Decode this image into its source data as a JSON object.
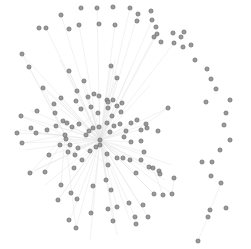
{
  "graph": {
    "title": "",
    "width": 251,
    "height": 249,
    "node_radius": 2.1,
    "colors": {
      "background": "#ffffff",
      "node_fill": "#9a9a9a",
      "node_stroke": "#5c5c5c",
      "edge": "#e4e4e4"
    },
    "hubs": [
      {
        "id": "hub1",
        "x": 100,
        "y": 140
      },
      {
        "id": "hub2",
        "x": 65,
        "y": 135
      }
    ],
    "nodes": [
      [
        61,
        15
      ],
      [
        81,
        8
      ],
      [
        97,
        8
      ],
      [
        113,
        7
      ],
      [
        130,
        8
      ],
      [
        151,
        11
      ],
      [
        138,
        14
      ],
      [
        39,
        28
      ],
      [
        46,
        28
      ],
      [
        69,
        29
      ],
      [
        79,
        25
      ],
      [
        99,
        24
      ],
      [
        115,
        25
      ],
      [
        137,
        21
      ],
      [
        152,
        20
      ],
      [
        156,
        27
      ],
      [
        157,
        34
      ],
      [
        173,
        33
      ],
      [
        174,
        43
      ],
      [
        191,
        45
      ],
      [
        181,
        37
      ],
      [
        195,
        60
      ],
      [
        207,
        69
      ],
      [
        211,
        79
      ],
      [
        216,
        89
      ],
      [
        206,
        102
      ],
      [
        230,
        100
      ],
      [
        226,
        113
      ],
      [
        224,
        125
      ],
      [
        230,
        140
      ],
      [
        220,
        150
      ],
      [
        212,
        162
      ],
      [
        154,
        37
      ],
      [
        161,
        42
      ],
      [
        184,
        32
      ],
      [
        183,
        47
      ],
      [
        22,
        54
      ],
      [
        29,
        67
      ],
      [
        69,
        71
      ],
      [
        111,
        66
      ],
      [
        117,
        78
      ],
      [
        84,
        81
      ],
      [
        43,
        88
      ],
      [
        77,
        91
      ],
      [
        107,
        100
      ],
      [
        108,
        108
      ],
      [
        21,
        116
      ],
      [
        37,
        111
      ],
      [
        54,
        104
      ],
      [
        55,
        113
      ],
      [
        61,
        98
      ],
      [
        63,
        121
      ],
      [
        76,
        101
      ],
      [
        81,
        109
      ],
      [
        88,
        97
      ],
      [
        94,
        94
      ],
      [
        99,
        96
      ],
      [
        108,
        102
      ],
      [
        113,
        100
      ],
      [
        117,
        106
      ],
      [
        122,
        103
      ],
      [
        121,
        112
      ],
      [
        112,
        116
      ],
      [
        98,
        113
      ],
      [
        91,
        107
      ],
      [
        17,
        133
      ],
      [
        22,
        143
      ],
      [
        31,
        128
      ],
      [
        36,
        133
      ],
      [
        47,
        130
      ],
      [
        56,
        126
      ],
      [
        67,
        123
      ],
      [
        72,
        127
      ],
      [
        79,
        124
      ],
      [
        66,
        139
      ],
      [
        70,
        145
      ],
      [
        78,
        148
      ],
      [
        86,
        135
      ],
      [
        89,
        131
      ],
      [
        93,
        128
      ],
      [
        99,
        127
      ],
      [
        107,
        123
      ],
      [
        114,
        126
      ],
      [
        120,
        124
      ],
      [
        126,
        131
      ],
      [
        131,
        123
      ],
      [
        137,
        120
      ],
      [
        141,
        130
      ],
      [
        147,
        128
      ],
      [
        141,
        141
      ],
      [
        131,
        142
      ],
      [
        124,
        137
      ],
      [
        110,
        132
      ],
      [
        168,
        108
      ],
      [
        146,
        124
      ],
      [
        158,
        131
      ],
      [
        30,
        173
      ],
      [
        45,
        172
      ],
      [
        49,
        155
      ],
      [
        60,
        145
      ],
      [
        68,
        152
      ],
      [
        75,
        155
      ],
      [
        74,
        168
      ],
      [
        82,
        160
      ],
      [
        90,
        151
      ],
      [
        96,
        147
      ],
      [
        100,
        145
      ],
      [
        107,
        154
      ],
      [
        108,
        165
      ],
      [
        117,
        158
      ],
      [
        123,
        158
      ],
      [
        130,
        160
      ],
      [
        136,
        173
      ],
      [
        141,
        160
      ],
      [
        149,
        167
      ],
      [
        159,
        171
      ],
      [
        144,
        152
      ],
      [
        174,
        178
      ],
      [
        172,
        194
      ],
      [
        163,
        195
      ],
      [
        153,
        168
      ],
      [
        93,
        186
      ],
      [
        106,
        180
      ],
      [
        111,
        190
      ],
      [
        117,
        207
      ],
      [
        129,
        203
      ],
      [
        135,
        217
      ],
      [
        143,
        205
      ],
      [
        154,
        194
      ],
      [
        160,
        174
      ],
      [
        71,
        193
      ],
      [
        77,
        199
      ],
      [
        91,
        213
      ],
      [
        108,
        209
      ],
      [
        113,
        221
      ],
      [
        136,
        224
      ],
      [
        148,
        217
      ],
      [
        61,
        185
      ],
      [
        58,
        200
      ],
      [
        69,
        220
      ],
      [
        76,
        228
      ],
      [
        211,
        176
      ],
      [
        221,
        183
      ],
      [
        226,
        208
      ],
      [
        210,
        210
      ],
      [
        208,
        217
      ],
      [
        198,
        241
      ],
      [
        202,
        162
      ]
    ],
    "edges_from_hub1": [
      [
        60,
        100
      ],
      [
        45,
        88
      ],
      [
        30,
        110
      ],
      [
        20,
        130
      ],
      [
        25,
        150
      ],
      [
        35,
        170
      ],
      [
        45,
        185
      ],
      [
        58,
        200
      ],
      [
        70,
        220
      ],
      [
        90,
        240
      ],
      [
        117,
        235
      ],
      [
        130,
        220
      ],
      [
        140,
        205
      ],
      [
        155,
        195
      ],
      [
        165,
        180
      ],
      [
        172,
        165
      ],
      [
        168,
        108
      ],
      [
        150,
        85
      ],
      [
        130,
        70
      ],
      [
        115,
        60
      ],
      [
        111,
        66
      ],
      [
        84,
        81
      ],
      [
        69,
        71
      ],
      [
        60,
        60
      ]
    ],
    "edges_from_hub2": [
      [
        22,
        54
      ],
      [
        29,
        67
      ],
      [
        43,
        88
      ],
      [
        21,
        116
      ],
      [
        17,
        133
      ],
      [
        22,
        143
      ],
      [
        30,
        173
      ],
      [
        45,
        172
      ],
      [
        61,
        185
      ],
      [
        76,
        228
      ],
      [
        108,
        165
      ],
      [
        98,
        113
      ]
    ],
    "extra_edges": [
      [
        [
          111,
          66
        ],
        [
          117,
          78
        ]
      ],
      [
        [
          117,
          78
        ],
        [
          108,
          100
        ]
      ],
      [
        [
          146,
          124
        ],
        [
          168,
          108
        ]
      ],
      [
        [
          174,
          178
        ],
        [
          172,
          194
        ]
      ],
      [
        [
          163,
          195
        ],
        [
          153,
          168
        ]
      ],
      [
        [
          198,
          241
        ],
        [
          208,
          217
        ]
      ],
      [
        [
          210,
          210
        ],
        [
          221,
          183
        ]
      ]
    ]
  }
}
